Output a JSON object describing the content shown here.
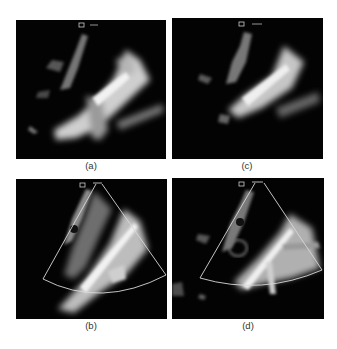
{
  "figure": {
    "panels": [
      {
        "id": "a",
        "label": "(a)",
        "description": "Ultrasound B-mode image without sector overlay"
      },
      {
        "id": "c",
        "label": "(c)",
        "description": "Ultrasound B-mode image without sector overlay"
      },
      {
        "id": "b",
        "label": "(b)",
        "description": "Ultrasound image with color-flow sector outline"
      },
      {
        "id": "d",
        "label": "(d)",
        "description": "Ultrasound image with color-flow sector outline"
      }
    ],
    "colors": {
      "background": "#ffffff",
      "image_background": "#030303",
      "sector_outline": "#d8d8d8",
      "label_text": "#333333"
    }
  }
}
